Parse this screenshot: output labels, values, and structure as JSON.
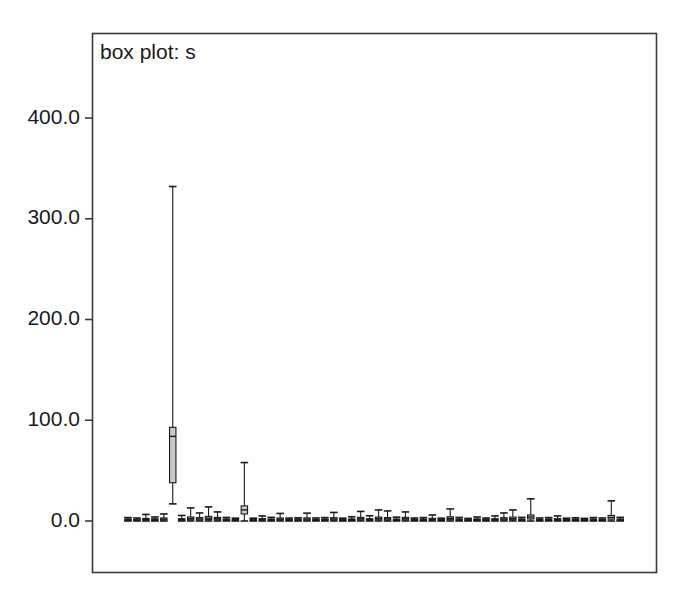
{
  "figure": {
    "width": 691,
    "height": 607,
    "background_color": "#ffffff"
  },
  "chart_data": {
    "type": "box",
    "title": "box plot: s",
    "xlabel": "",
    "ylabel": "",
    "ylim": [
      -60,
      460
    ],
    "yticks": [
      0,
      100,
      200,
      300,
      400
    ],
    "ytick_labels": [
      "0.0",
      "100.0",
      "200.0",
      "300.0",
      "400.0"
    ],
    "xticks": [],
    "xtick_labels": [],
    "grid": false,
    "legend": false,
    "frame_color": "#3a3a3a",
    "box_fill_color": "#c8c8c8",
    "box_line_color": "#1a1a1a",
    "n_boxes": 56,
    "boxes": [
      {
        "index": 1,
        "whisker_low": 0.0,
        "q1": 0.6,
        "median": 1.2,
        "q3": 2.0,
        "whisker_high": 3.4
      },
      {
        "index": 2,
        "whisker_low": 0.0,
        "q1": 0.5,
        "median": 1.0,
        "q3": 1.8,
        "whisker_high": 3.0
      },
      {
        "index": 3,
        "whisker_low": 0.0,
        "q1": 0.8,
        "median": 1.6,
        "q3": 2.6,
        "whisker_high": 6.5
      },
      {
        "index": 4,
        "whisker_low": 0.0,
        "q1": 0.6,
        "median": 1.3,
        "q3": 2.2,
        "whisker_high": 4.0
      },
      {
        "index": 5,
        "whisker_low": 0.0,
        "q1": 0.9,
        "median": 1.8,
        "q3": 3.0,
        "whisker_high": 7.0
      },
      {
        "index": 6,
        "whisker_low": 17.0,
        "q1": 38.0,
        "median": 84.0,
        "q3": 93.0,
        "whisker_high": 332.0
      },
      {
        "index": 7,
        "whisker_low": 0.0,
        "q1": 0.7,
        "median": 1.4,
        "q3": 2.3,
        "whisker_high": 5.5
      },
      {
        "index": 8,
        "whisker_low": 0.0,
        "q1": 1.2,
        "median": 2.4,
        "q3": 4.0,
        "whisker_high": 13.0
      },
      {
        "index": 9,
        "whisker_low": 0.0,
        "q1": 1.0,
        "median": 2.0,
        "q3": 3.4,
        "whisker_high": 8.0
      },
      {
        "index": 10,
        "whisker_low": 0.0,
        "q1": 1.4,
        "median": 2.8,
        "q3": 4.6,
        "whisker_high": 14.0
      },
      {
        "index": 11,
        "whisker_low": 0.0,
        "q1": 1.1,
        "median": 2.2,
        "q3": 3.6,
        "whisker_high": 9.0
      },
      {
        "index": 12,
        "whisker_low": 0.0,
        "q1": 0.6,
        "median": 1.2,
        "q3": 2.0,
        "whisker_high": 3.5
      },
      {
        "index": 13,
        "whisker_low": 0.0,
        "q1": 0.5,
        "median": 1.0,
        "q3": 1.7,
        "whisker_high": 2.8
      },
      {
        "index": 14,
        "whisker_low": 0.0,
        "q1": 7.0,
        "median": 11.0,
        "q3": 15.0,
        "whisker_high": 58.0
      },
      {
        "index": 15,
        "whisker_low": 0.0,
        "q1": 0.5,
        "median": 1.0,
        "q3": 1.7,
        "whisker_high": 2.8
      },
      {
        "index": 16,
        "whisker_low": 0.0,
        "q1": 0.7,
        "median": 1.4,
        "q3": 2.3,
        "whisker_high": 5.0
      },
      {
        "index": 17,
        "whisker_low": 0.0,
        "q1": 0.6,
        "median": 1.2,
        "q3": 2.0,
        "whisker_high": 3.6
      },
      {
        "index": 18,
        "whisker_low": 0.0,
        "q1": 0.9,
        "median": 1.8,
        "q3": 3.0,
        "whisker_high": 7.5
      },
      {
        "index": 19,
        "whisker_low": 0.0,
        "q1": 0.5,
        "median": 1.0,
        "q3": 1.7,
        "whisker_high": 2.9
      },
      {
        "index": 20,
        "whisker_low": 0.0,
        "q1": 0.6,
        "median": 1.2,
        "q3": 2.0,
        "whisker_high": 3.2
      },
      {
        "index": 21,
        "whisker_low": 0.0,
        "q1": 0.9,
        "median": 1.9,
        "q3": 3.1,
        "whisker_high": 7.8
      },
      {
        "index": 22,
        "whisker_low": 0.0,
        "q1": 0.5,
        "median": 1.1,
        "q3": 1.8,
        "whisker_high": 3.0
      },
      {
        "index": 23,
        "whisker_low": 0.0,
        "q1": 0.6,
        "median": 1.2,
        "q3": 2.0,
        "whisker_high": 3.4
      },
      {
        "index": 24,
        "whisker_low": 0.0,
        "q1": 1.0,
        "median": 2.0,
        "q3": 3.3,
        "whisker_high": 8.5
      },
      {
        "index": 25,
        "whisker_low": 0.0,
        "q1": 0.5,
        "median": 1.0,
        "q3": 1.7,
        "whisker_high": 2.8
      },
      {
        "index": 26,
        "whisker_low": 0.0,
        "q1": 0.6,
        "median": 1.3,
        "q3": 2.1,
        "whisker_high": 4.2
      },
      {
        "index": 27,
        "whisker_low": 0.0,
        "q1": 1.1,
        "median": 2.2,
        "q3": 3.6,
        "whisker_high": 9.5
      },
      {
        "index": 28,
        "whisker_low": 0.0,
        "q1": 0.7,
        "median": 1.4,
        "q3": 2.3,
        "whisker_high": 5.2
      },
      {
        "index": 29,
        "whisker_low": 0.0,
        "q1": 1.2,
        "median": 2.4,
        "q3": 3.9,
        "whisker_high": 11.0
      },
      {
        "index": 30,
        "whisker_low": 0.0,
        "q1": 1.0,
        "median": 2.1,
        "q3": 3.4,
        "whisker_high": 10.0
      },
      {
        "index": 31,
        "whisker_low": 0.0,
        "q1": 0.6,
        "median": 1.2,
        "q3": 2.0,
        "whisker_high": 3.8
      },
      {
        "index": 32,
        "whisker_low": 0.0,
        "q1": 1.1,
        "median": 2.2,
        "q3": 3.6,
        "whisker_high": 9.0
      },
      {
        "index": 33,
        "whisker_low": 0.0,
        "q1": 0.5,
        "median": 1.1,
        "q3": 1.8,
        "whisker_high": 3.0
      },
      {
        "index": 34,
        "whisker_low": 0.0,
        "q1": 0.6,
        "median": 1.2,
        "q3": 2.0,
        "whisker_high": 3.4
      },
      {
        "index": 35,
        "whisker_low": 0.0,
        "q1": 0.8,
        "median": 1.6,
        "q3": 2.7,
        "whisker_high": 6.0
      },
      {
        "index": 36,
        "whisker_low": 0.0,
        "q1": 0.5,
        "median": 1.0,
        "q3": 1.7,
        "whisker_high": 2.8
      },
      {
        "index": 37,
        "whisker_low": 0.0,
        "q1": 1.3,
        "median": 2.6,
        "q3": 4.2,
        "whisker_high": 12.0
      },
      {
        "index": 38,
        "whisker_low": 0.0,
        "q1": 0.6,
        "median": 1.2,
        "q3": 2.0,
        "whisker_high": 3.5
      },
      {
        "index": 39,
        "whisker_low": 0.0,
        "q1": 0.5,
        "median": 1.0,
        "q3": 1.7,
        "whisker_high": 2.6
      },
      {
        "index": 40,
        "whisker_low": 0.0,
        "q1": 0.6,
        "median": 1.3,
        "q3": 2.1,
        "whisker_high": 4.0
      },
      {
        "index": 41,
        "whisker_low": 0.0,
        "q1": 0.5,
        "median": 1.1,
        "q3": 1.8,
        "whisker_high": 3.0
      },
      {
        "index": 42,
        "whisker_low": 0.0,
        "q1": 0.7,
        "median": 1.4,
        "q3": 2.3,
        "whisker_high": 5.0
      },
      {
        "index": 43,
        "whisker_low": 0.0,
        "q1": 1.0,
        "median": 2.0,
        "q3": 3.3,
        "whisker_high": 8.0
      },
      {
        "index": 44,
        "whisker_low": 0.0,
        "q1": 1.2,
        "median": 2.4,
        "q3": 3.9,
        "whisker_high": 11.0
      },
      {
        "index": 45,
        "whisker_low": 0.0,
        "q1": 0.6,
        "median": 1.2,
        "q3": 2.0,
        "whisker_high": 3.6
      },
      {
        "index": 46,
        "whisker_low": 0.0,
        "q1": 2.0,
        "median": 4.0,
        "q3": 6.0,
        "whisker_high": 22.0
      },
      {
        "index": 47,
        "whisker_low": 0.0,
        "q1": 0.5,
        "median": 1.1,
        "q3": 1.8,
        "whisker_high": 3.0
      },
      {
        "index": 48,
        "whisker_low": 0.0,
        "q1": 0.6,
        "median": 1.2,
        "q3": 2.0,
        "whisker_high": 3.4
      },
      {
        "index": 49,
        "whisker_low": 0.0,
        "q1": 0.7,
        "median": 1.4,
        "q3": 2.3,
        "whisker_high": 5.0
      },
      {
        "index": 50,
        "whisker_low": 0.0,
        "q1": 0.5,
        "median": 1.0,
        "q3": 1.7,
        "whisker_high": 2.8
      },
      {
        "index": 51,
        "whisker_low": 0.0,
        "q1": 0.6,
        "median": 1.2,
        "q3": 2.0,
        "whisker_high": 3.2
      },
      {
        "index": 52,
        "whisker_low": 0.0,
        "q1": 0.5,
        "median": 1.0,
        "q3": 1.7,
        "whisker_high": 2.6
      },
      {
        "index": 53,
        "whisker_low": 0.0,
        "q1": 0.6,
        "median": 1.2,
        "q3": 2.0,
        "whisker_high": 3.4
      },
      {
        "index": 54,
        "whisker_low": 0.0,
        "q1": 0.5,
        "median": 1.1,
        "q3": 1.8,
        "whisker_high": 3.0
      },
      {
        "index": 55,
        "whisker_low": 0.0,
        "q1": 1.8,
        "median": 3.5,
        "q3": 5.5,
        "whisker_high": 20.0
      },
      {
        "index": 56,
        "whisker_low": 0.0,
        "q1": 0.6,
        "median": 1.2,
        "q3": 2.0,
        "whisker_high": 3.6
      }
    ]
  },
  "axes": {
    "plot_left": 92,
    "plot_right": 657,
    "plot_top": 33,
    "plot_bottom": 573,
    "y_zero_px": 521,
    "y_400_px": 118,
    "first_box_x": 128,
    "box_spacing": 8.95,
    "box_half_width": 3.2
  }
}
